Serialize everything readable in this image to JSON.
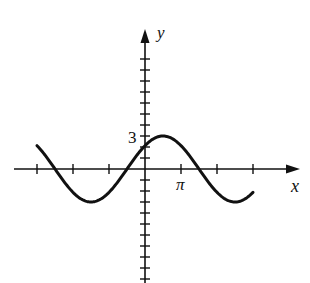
{
  "chart_data": {
    "type": "line",
    "title": "",
    "xlabel": "x",
    "ylabel": "y",
    "function": "y = 3 sin((x + π/2)/2)",
    "amplitude": 3,
    "period": "4π",
    "x_tick_spacing": "π",
    "y_tick_spacing": 1,
    "x_tick_labels": [
      {
        "value": "π",
        "position": 3.14159
      }
    ],
    "y_tick_labels": [
      {
        "value": "3",
        "position": 3
      }
    ],
    "xlim": [
      -3.14159,
      3.14159
    ],
    "ylim": [
      -8,
      8
    ],
    "x_ticks": [
      -9.42478,
      -6.28319,
      -3.14159,
      3.14159,
      6.28319,
      9.42478
    ],
    "series": [
      {
        "name": "curve",
        "x_range": [
          -9.42478,
          9.42478
        ],
        "points": [
          {
            "x": -9.42478,
            "y": 2.12
          },
          {
            "x": -7.85398,
            "y": 0
          },
          {
            "x": -4.71239,
            "y": -3
          },
          {
            "x": -1.5708,
            "y": 0
          },
          {
            "x": 0,
            "y": 2.12
          },
          {
            "x": 1.5708,
            "y": 3
          },
          {
            "x": 4.71239,
            "y": 0
          },
          {
            "x": 7.85398,
            "y": -3
          },
          {
            "x": 9.42478,
            "y": -2.12
          }
        ]
      }
    ],
    "grid": false,
    "legend": null
  },
  "labels": {
    "x_axis": "x",
    "y_axis": "y",
    "pi": "π",
    "three": "3"
  }
}
